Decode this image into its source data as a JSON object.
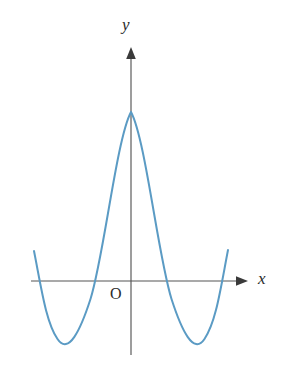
{
  "figure": {
    "title": "",
    "background_color": "#ffffff",
    "width": 281,
    "height": 369
  },
  "labels": {
    "y_axis": "y",
    "x_axis": "x",
    "origin": "O"
  },
  "colors": {
    "curve": "#5b9bc4",
    "axis": "#555555",
    "text": "#2b2b2b",
    "background": "#ffffff"
  },
  "chart_data": {
    "type": "line",
    "title": "",
    "xlabel": "x",
    "ylabel": "y",
    "origin_label": "O",
    "grid": false,
    "legend": null,
    "axes": {
      "x_axis_drawn": true,
      "y_axis_drawn": true,
      "x_arrowhead": true,
      "y_arrowhead": true,
      "tick_marks": false,
      "tick_labels": [],
      "xlim": [
        -2.6,
        2.6
      ],
      "ylim": [
        -1.1,
        2.6
      ]
    },
    "features": {
      "local_maximum": {
        "x": 0.0,
        "y": 2.05
      },
      "local_minima": [
        {
          "x": -1.15,
          "y": -0.8
        },
        {
          "x": 1.15,
          "y": -0.8
        }
      ],
      "x_intercepts": [
        -2.2,
        -0.66,
        0.66,
        2.2
      ],
      "y_intercept": 2.05,
      "symmetry": "even (about y-axis)"
    },
    "x": [
      -2.45,
      -2.3,
      -2.2,
      -2.05,
      -1.9,
      -1.75,
      -1.6,
      -1.45,
      -1.3,
      -1.15,
      -1.0,
      -0.85,
      -0.7,
      -0.55,
      -0.4,
      -0.25,
      -0.1,
      0.0,
      0.1,
      0.25,
      0.4,
      0.55,
      0.7,
      0.85,
      1.0,
      1.15,
      1.3,
      1.45,
      1.6,
      1.75,
      1.9,
      2.05,
      2.2,
      2.3,
      2.45
    ],
    "y": [
      0.72,
      0.22,
      0.0,
      -0.34,
      -0.58,
      -0.72,
      -0.79,
      -0.82,
      -0.81,
      -0.8,
      -0.7,
      -0.48,
      -0.13,
      0.35,
      0.92,
      1.49,
      1.95,
      2.05,
      1.95,
      1.49,
      0.92,
      0.35,
      -0.13,
      -0.48,
      -0.7,
      -0.8,
      -0.81,
      -0.82,
      -0.79,
      -0.72,
      -0.58,
      -0.34,
      0.0,
      0.22,
      0.72
    ],
    "pixel_geometry": {
      "origin_px": {
        "x": 131,
        "y": 281
      },
      "x_axis_span_px": {
        "x1": 31,
        "x2": 248,
        "y": 281
      },
      "y_axis_span_px": {
        "x": 131,
        "y1": 48,
        "y2": 355
      },
      "curve_path": "M 34 251 C 42 288 46 322 57 339 C 68 356 80 331 90 300 C 104 257 116 140 131 112 C 146 140 158 257 172 300 C 182 331 194 356 205 339 C 216 322 220 288 228 250",
      "stroke_width": 2.0
    }
  }
}
